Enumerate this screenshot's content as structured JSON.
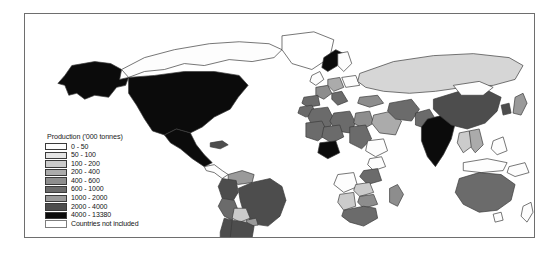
{
  "figure": {
    "type": "choropleth-world-map",
    "frame_border_color": "#6e6e6e",
    "background_color": "#ffffff",
    "ocean_color": "#ffffff",
    "country_outline_color": "#3b3b3b"
  },
  "legend": {
    "title": "Production ('000 tonnes)",
    "items": [
      {
        "label": "0 - 50",
        "color": "#fdfdfd",
        "min": 0,
        "max": 50
      },
      {
        "label": "50 - 100",
        "color": "#e4e4e4",
        "min": 50,
        "max": 100
      },
      {
        "label": "100 - 200",
        "color": "#cbcbcb",
        "min": 100,
        "max": 200
      },
      {
        "label": "200 - 400",
        "color": "#ababab",
        "min": 200,
        "max": 400
      },
      {
        "label": "400 - 600",
        "color": "#8d8d8d",
        "min": 400,
        "max": 600
      },
      {
        "label": "600 - 1000",
        "color": "#6b6b6b",
        "min": 600,
        "max": 1000
      },
      {
        "label": "1000 - 2000",
        "color": "#9a9a9a",
        "min": 1000,
        "max": 2000
      },
      {
        "label": "2000 - 4000",
        "color": "#4d4d4d",
        "min": 2000,
        "max": 4000
      },
      {
        "label": "4000 - 13380",
        "color": "#0b0b0b",
        "min": 4000,
        "max": 13380
      },
      {
        "label": "Countries not included",
        "color": "#ffffff",
        "min": null,
        "max": null
      }
    ]
  },
  "chart_data": {
    "type": "heatmap",
    "title": "Production ('000 tonnes)",
    "xlabel": "",
    "ylabel": "",
    "legend_position": "inset-left",
    "grid": false,
    "categories": [
      "0 - 50",
      "50 - 100",
      "100 - 200",
      "200 - 400",
      "400 - 600",
      "600 - 1000",
      "1000 - 2000",
      "2000 - 4000",
      "4000 - 13380",
      "Countries not included"
    ],
    "value_range": [
      0,
      13380
    ],
    "regions": [
      {
        "name": "United States of America",
        "class": "4000 - 13380",
        "shade": "#0b0b0b"
      },
      {
        "name": "Alaska",
        "class": "4000 - 13380",
        "shade": "#0b0b0b"
      },
      {
        "name": "Canada",
        "class": "0 - 50",
        "shade": "#fdfdfd"
      },
      {
        "name": "Greenland",
        "class": "Countries not included",
        "shade": "#ffffff"
      },
      {
        "name": "Mexico",
        "class": "4000 - 13380",
        "shade": "#0b0b0b"
      },
      {
        "name": "Cuba",
        "class": "2000 - 4000",
        "shade": "#4d4d4d"
      },
      {
        "name": "Venezuela",
        "class": "1000 - 2000",
        "shade": "#9a9a9a"
      },
      {
        "name": "Colombia",
        "class": "2000 - 4000",
        "shade": "#4d4d4d"
      },
      {
        "name": "Peru",
        "class": "600 - 1000",
        "shade": "#6b6b6b"
      },
      {
        "name": "Bolivia",
        "class": "100 - 200",
        "shade": "#cbcbcb"
      },
      {
        "name": "Brazil",
        "class": "2000 - 4000",
        "shade": "#4d4d4d"
      },
      {
        "name": "Paraguay",
        "class": "1000 - 2000",
        "shade": "#9a9a9a"
      },
      {
        "name": "Chile",
        "class": "2000 - 4000",
        "shade": "#4d4d4d"
      },
      {
        "name": "Argentina",
        "class": "2000 - 4000",
        "shade": "#4d4d4d"
      },
      {
        "name": "United Kingdom",
        "class": "0 - 50",
        "shade": "#fdfdfd"
      },
      {
        "name": "France",
        "class": "400 - 600",
        "shade": "#8d8d8d"
      },
      {
        "name": "Spain",
        "class": "600 - 1000",
        "shade": "#6b6b6b"
      },
      {
        "name": "Germany",
        "class": "200 - 400",
        "shade": "#ababab"
      },
      {
        "name": "Italy",
        "class": "600 - 1000",
        "shade": "#6b6b6b"
      },
      {
        "name": "Norway",
        "class": "4000 - 13380",
        "shade": "#0b0b0b"
      },
      {
        "name": "Sweden",
        "class": "0 - 50",
        "shade": "#fdfdfd"
      },
      {
        "name": "Poland",
        "class": "0 - 50",
        "shade": "#fdfdfd"
      },
      {
        "name": "Russian Federation",
        "class": "1000 - 2000",
        "shade": "#d6d6d6"
      },
      {
        "name": "Turkey",
        "class": "400 - 600",
        "shade": "#8d8d8d"
      },
      {
        "name": "Egypt",
        "class": "400 - 600",
        "shade": "#8d8d8d"
      },
      {
        "name": "Morocco",
        "class": "600 - 1000",
        "shade": "#6b6b6b"
      },
      {
        "name": "Algeria",
        "class": "600 - 1000",
        "shade": "#6b6b6b"
      },
      {
        "name": "Libya",
        "class": "600 - 1000",
        "shade": "#6b6b6b"
      },
      {
        "name": "Sudan",
        "class": "600 - 1000",
        "shade": "#6b6b6b"
      },
      {
        "name": "Mali",
        "class": "600 - 1000",
        "shade": "#6b6b6b"
      },
      {
        "name": "Niger",
        "class": "600 - 1000",
        "shade": "#6b6b6b"
      },
      {
        "name": "Nigeria",
        "class": "4000 - 13380",
        "shade": "#0b0b0b"
      },
      {
        "name": "Ethiopia",
        "class": "0 - 50",
        "shade": "#fdfdfd"
      },
      {
        "name": "Kenya",
        "class": "0 - 50",
        "shade": "#fdfdfd"
      },
      {
        "name": "Tanzania",
        "class": "600 - 1000",
        "shade": "#6b6b6b"
      },
      {
        "name": "Angola",
        "class": "0 - 50",
        "shade": "#fdfdfd"
      },
      {
        "name": "Zambia",
        "class": "100 - 200",
        "shade": "#cbcbcb"
      },
      {
        "name": "Zimbabwe",
        "class": "400 - 600",
        "shade": "#8d8d8d"
      },
      {
        "name": "Madagascar",
        "class": "400 - 600",
        "shade": "#8d8d8d"
      },
      {
        "name": "South Africa",
        "class": "600 - 1000",
        "shade": "#6b6b6b"
      },
      {
        "name": "Namibia",
        "class": "100 - 200",
        "shade": "#cbcbcb"
      },
      {
        "name": "Saudi Arabia",
        "class": "200 - 400",
        "shade": "#ababab"
      },
      {
        "name": "Iran",
        "class": "600 - 1000",
        "shade": "#6b6b6b"
      },
      {
        "name": "Pakistan",
        "class": "600 - 1000",
        "shade": "#6b6b6b"
      },
      {
        "name": "India",
        "class": "4000 - 13380",
        "shade": "#0b0b0b"
      },
      {
        "name": "China",
        "class": "2000 - 4000",
        "shade": "#4d4d4d"
      },
      {
        "name": "Mongolia",
        "class": "0 - 50",
        "shade": "#fdfdfd"
      },
      {
        "name": "Korea",
        "class": "2000 - 4000",
        "shade": "#4d4d4d"
      },
      {
        "name": "Japan",
        "class": "1000 - 2000",
        "shade": "#9a9a9a"
      },
      {
        "name": "Thailand",
        "class": "100 - 200",
        "shade": "#cbcbcb"
      },
      {
        "name": "Viet Nam",
        "class": "200 - 400",
        "shade": "#ababab"
      },
      {
        "name": "Indonesia",
        "class": "0 - 50",
        "shade": "#fdfdfd"
      },
      {
        "name": "Philippines",
        "class": "0 - 50",
        "shade": "#fdfdfd"
      },
      {
        "name": "Papua New Guinea",
        "class": "0 - 50",
        "shade": "#fdfdfd"
      },
      {
        "name": "Australia",
        "class": "600 - 1000",
        "shade": "#6b6b6b"
      },
      {
        "name": "New Zealand",
        "class": "0 - 50",
        "shade": "#fdfdfd"
      }
    ]
  }
}
